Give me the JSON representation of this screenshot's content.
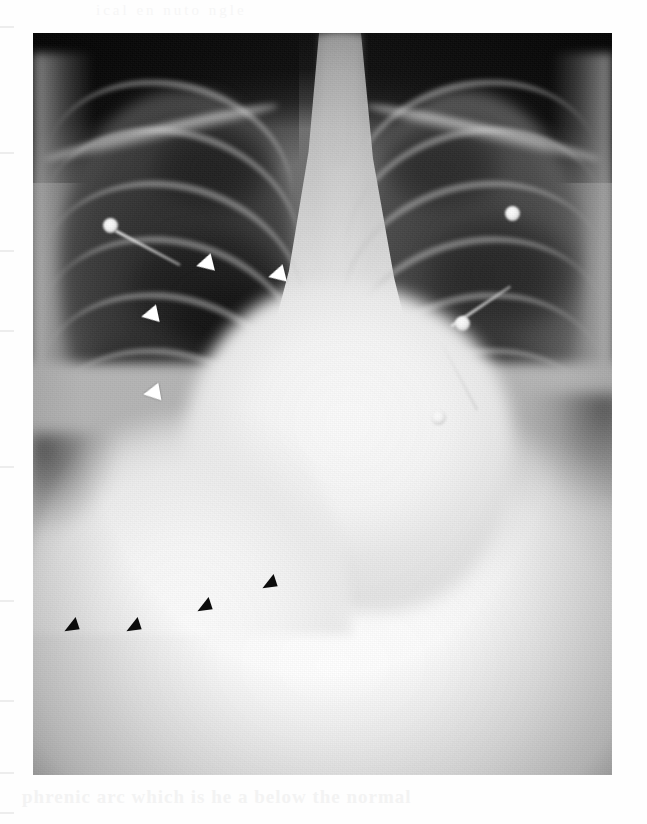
{
  "figure": {
    "kind": "radiograph",
    "modality": "chest-radiograph",
    "view": "posteroanterior",
    "caption_bleed_top": "ical   en   nuto   ngle",
    "caption_bleed_bottom": "phrenic arc which is   he   a below the normal",
    "caption_bleed_bottom2": "",
    "background_color": "#ffffff",
    "film_frame": {
      "x": 33,
      "y": 33,
      "width": 579,
      "height": 742
    }
  },
  "annotations": {
    "white_arrowheads": {
      "label": "white-arrowhead",
      "color": "#ffffff",
      "meaning": "minor fissure / right lung markings",
      "count": 4,
      "points": [
        {
          "left": 163,
          "top": 222,
          "rotate": -14
        },
        {
          "left": 235,
          "top": 233,
          "rotate": -14
        },
        {
          "left": 108,
          "top": 273,
          "rotate": -12
        },
        {
          "left": 110,
          "top": 351,
          "rotate": -10
        }
      ]
    },
    "black_arrowheads": {
      "label": "black-arrowhead",
      "color": "#0b0b0b",
      "meaning": "elevated right hemidiaphragm contour",
      "count": 4,
      "points": [
        {
          "left": 30,
          "top": 586,
          "rotate": -18
        },
        {
          "left": 92,
          "top": 586,
          "rotate": -18
        },
        {
          "left": 163,
          "top": 566,
          "rotate": -18
        },
        {
          "left": 228,
          "top": 543,
          "rotate": -18
        }
      ]
    }
  },
  "anatomy": {
    "structures": [
      {
        "name": "right-lung-field",
        "tone": "radiolucent-dark"
      },
      {
        "name": "left-lung-field",
        "tone": "radiolucent-dark"
      },
      {
        "name": "mediastinum",
        "tone": "radiopaque-light"
      },
      {
        "name": "cardiac-silhouette",
        "tone": "radiopaque-light"
      },
      {
        "name": "trachea",
        "tone": "air-column"
      },
      {
        "name": "thoracic-spine",
        "tone": "radiopaque-light"
      },
      {
        "name": "right-hemidiaphragm",
        "tone": "elevated"
      },
      {
        "name": "left-hemidiaphragm",
        "tone": "normal"
      },
      {
        "name": "right-costophrenic-angle",
        "tone": "dark"
      },
      {
        "name": "left-costophrenic-angle",
        "tone": "dark"
      },
      {
        "name": "clavicle-right",
        "tone": "bone"
      },
      {
        "name": "clavicle-left",
        "tone": "bone"
      },
      {
        "name": "abdomen",
        "tone": "radiopaque-light"
      }
    ]
  },
  "devices": {
    "ecg_electrodes": [
      {
        "name": "ecg-electrode-right-upper",
        "left": 70,
        "top": 185
      },
      {
        "name": "ecg-electrode-left-upper",
        "left": 472,
        "top": 173
      },
      {
        "name": "ecg-electrode-left-mid",
        "left": 422,
        "top": 283
      },
      {
        "name": "ecg-electrode-left-lower",
        "left": 398,
        "top": 377
      }
    ],
    "ecg_leads": [
      {
        "name": "ecg-lead-right",
        "left": 82,
        "top": 196,
        "length": 74,
        "angle": 28
      },
      {
        "name": "ecg-lead-left-upper",
        "left": 418,
        "top": 292,
        "length": 72,
        "angle": -34
      },
      {
        "name": "ecg-lead-left-lower",
        "left": 404,
        "top": 300,
        "length": 86,
        "angle": 62
      }
    ]
  },
  "ribs": {
    "right": [
      {
        "left": 10,
        "top": 48,
        "w": 250,
        "h": 190,
        "rot": 14
      },
      {
        "left": 6,
        "top": 96,
        "w": 262,
        "h": 200,
        "rot": 15
      },
      {
        "left": 4,
        "top": 150,
        "w": 268,
        "h": 206,
        "rot": 16
      },
      {
        "left": 2,
        "top": 206,
        "w": 272,
        "h": 210,
        "rot": 17
      },
      {
        "left": 0,
        "top": 262,
        "w": 274,
        "h": 214,
        "rot": 18
      },
      {
        "left": 0,
        "top": 318,
        "w": 272,
        "h": 214,
        "rot": 19
      },
      {
        "left": 0,
        "top": 372,
        "w": 262,
        "h": 208,
        "rot": 20
      }
    ],
    "left": [
      {
        "left": 318,
        "top": 48,
        "w": 250,
        "h": 190,
        "rot": -14
      },
      {
        "left": 312,
        "top": 96,
        "w": 262,
        "h": 200,
        "rot": -15
      },
      {
        "left": 308,
        "top": 150,
        "w": 268,
        "h": 206,
        "rot": -16
      },
      {
        "left": 306,
        "top": 206,
        "w": 272,
        "h": 210,
        "rot": -17
      },
      {
        "left": 304,
        "top": 262,
        "w": 274,
        "h": 214,
        "rot": -18
      },
      {
        "left": 306,
        "top": 318,
        "w": 272,
        "h": 214,
        "rot": -19
      },
      {
        "left": 312,
        "top": 372,
        "w": 262,
        "h": 208,
        "rot": -20
      }
    ]
  },
  "clavicles": [
    {
      "name": "clavicle-right",
      "left": 8,
      "top": 92,
      "width": 240,
      "rot": -13
    },
    {
      "name": "clavicle-left",
      "left": 330,
      "top": 92,
      "width": 240,
      "rot": 13
    }
  ],
  "lucencies": [
    {
      "name": "right-upper-lucency",
      "left": 118,
      "top": 86,
      "w": 120,
      "h": 96,
      "shade": "#1e1e1e",
      "alpha": 0.85
    },
    {
      "name": "right-mid-lucency",
      "left": 96,
      "top": 196,
      "w": 160,
      "h": 120,
      "shade": "#1a1a1a",
      "alpha": 0.9
    },
    {
      "name": "right-lower-lucency",
      "left": 138,
      "top": 246,
      "w": 126,
      "h": 96,
      "shade": "#121212",
      "alpha": 0.92
    },
    {
      "name": "right-basal-lucency",
      "left": 46,
      "top": 300,
      "w": 150,
      "h": 110,
      "shade": "#262626",
      "alpha": 0.8
    },
    {
      "name": "left-upper-lucency",
      "left": 350,
      "top": 86,
      "w": 120,
      "h": 92,
      "shade": "#262626",
      "alpha": 0.82
    },
    {
      "name": "left-mid-lucency",
      "left": 392,
      "top": 182,
      "w": 150,
      "h": 118,
      "shade": "#242424",
      "alpha": 0.85
    },
    {
      "name": "left-lower-lucency",
      "left": 360,
      "top": 278,
      "w": 140,
      "h": 110,
      "shade": "#303030",
      "alpha": 0.78
    },
    {
      "name": "left-basal-lucency",
      "left": 430,
      "top": 330,
      "w": 130,
      "h": 110,
      "shade": "#3a3a3a",
      "alpha": 0.7
    }
  ],
  "margin_ticks": [
    {
      "top": 26
    },
    {
      "top": 152
    },
    {
      "top": 250
    },
    {
      "top": 330
    },
    {
      "top": 466
    },
    {
      "top": 600
    },
    {
      "top": 700
    },
    {
      "top": 772
    },
    {
      "top": 812
    }
  ]
}
